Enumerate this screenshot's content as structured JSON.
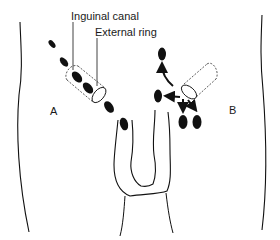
{
  "figure": {
    "colors": {
      "ink": "#111111",
      "background": "#ffffff"
    },
    "labels": {
      "inguinal_canal": "Inguinal canal",
      "external_ring": "External ring",
      "side_a": "A",
      "side_b": "B"
    },
    "side_a": {
      "descent_path_ovals": [
        {
          "cx": 52,
          "cy": 44,
          "rx": 2.5,
          "ry": 4.5,
          "rot": -40
        },
        {
          "cx": 64,
          "cy": 62,
          "rx": 3,
          "ry": 5,
          "rot": -40
        },
        {
          "cx": 77,
          "cy": 77,
          "rx": 4,
          "ry": 6.5,
          "rot": -40
        },
        {
          "cx": 88,
          "cy": 88,
          "rx": 4,
          "ry": 6.5,
          "rot": -40
        },
        {
          "cx": 108,
          "cy": 106,
          "rx": 4,
          "ry": 6.5,
          "rot": -35
        },
        {
          "cx": 124,
          "cy": 124,
          "rx": 4,
          "ry": 6.5,
          "rot": -15
        }
      ],
      "canal": {
        "x1": 72,
        "y1": 72,
        "x2": 100,
        "y2": 96
      }
    },
    "side_b": {
      "ectopic_ovals": [
        {
          "cx": 162,
          "cy": 54,
          "rx": 4,
          "ry": 6.5,
          "rot": 0
        },
        {
          "cx": 158,
          "cy": 95,
          "rx": 4,
          "ry": 6.5,
          "rot": 0
        },
        {
          "cx": 183,
          "cy": 122,
          "rx": 4.5,
          "ry": 7,
          "rot": 0
        },
        {
          "cx": 197,
          "cy": 122,
          "rx": 4.5,
          "ry": 7,
          "rot": 0
        }
      ],
      "canal": {
        "x1": 186,
        "y1": 92,
        "x2": 214,
        "y2": 70
      }
    }
  }
}
